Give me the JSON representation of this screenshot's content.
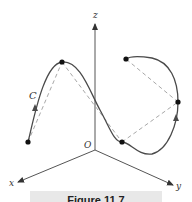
{
  "figure": {
    "caption": "Figure 11.7",
    "colors": {
      "axis": "#555555",
      "curve": "#4a4a4a",
      "chord": "#a8a8a8",
      "point": "#111111",
      "caption_band": "#e6e6e6"
    }
  },
  "axes": {
    "x_label": "x",
    "y_label": "y",
    "z_label": "z",
    "origin_label": "O"
  },
  "curve": {
    "label": "C",
    "point_count": 5,
    "orientation_arrows": 2
  }
}
